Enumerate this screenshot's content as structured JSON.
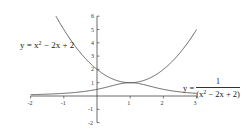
{
  "chart_data": {
    "type": "line",
    "title": "",
    "xlabel": "",
    "ylabel": "",
    "xlim": [
      -2,
      3
    ],
    "ylim": [
      -2,
      6
    ],
    "grid": false,
    "legend": "inline annotations",
    "x_ticks": [
      -2,
      -1,
      1,
      2,
      3
    ],
    "x_tick_labels": [
      "-2",
      "-1",
      "1",
      "2",
      "3"
    ],
    "y_ticks": [
      -2,
      -1,
      1,
      2,
      3,
      4,
      5,
      6
    ],
    "y_tick_labels": [
      "-2",
      "-1",
      "1",
      "2",
      "3",
      "4",
      "5",
      "6"
    ],
    "series": [
      {
        "name": "y = x² − 2x + 2",
        "formula": "x^2 - 2x + 2",
        "x": [
          -1.236,
          -1,
          -0.5,
          0,
          0.5,
          1,
          1.5,
          2,
          2.5,
          3
        ],
        "values": [
          6.0,
          5.0,
          3.25,
          2.0,
          1.25,
          1.0,
          1.25,
          2.0,
          3.25,
          5.0
        ],
        "color": "#555555"
      },
      {
        "name": "y = 1/(x² − 2x + 2)",
        "formula": "1/(x^2 - 2x + 2)",
        "x": [
          -2,
          -1.5,
          -1,
          -0.5,
          0,
          0.5,
          1,
          1.5,
          2,
          2.5,
          3
        ],
        "values": [
          0.1,
          0.138,
          0.2,
          0.308,
          0.5,
          0.8,
          1.0,
          0.8,
          0.5,
          0.308,
          0.2
        ],
        "color": "#555555"
      }
    ],
    "annotations": [
      {
        "text": "y = x² − 2x + 2",
        "position": "left of y-axis, near y≈4"
      },
      {
        "text": "y = 1/(x² − 2x + 2)",
        "position": "right, above x≈2.5–3"
      }
    ]
  },
  "labels": {
    "eq1_prefix": "y = x",
    "eq1_exp": "2",
    "eq1_suffix": " − 2x + 2",
    "eq2_prefix": "y =",
    "eq2_num": "1",
    "eq2_den_a": "(x",
    "eq2_den_exp": "2",
    "eq2_den_b": " − 2x + 2)"
  }
}
